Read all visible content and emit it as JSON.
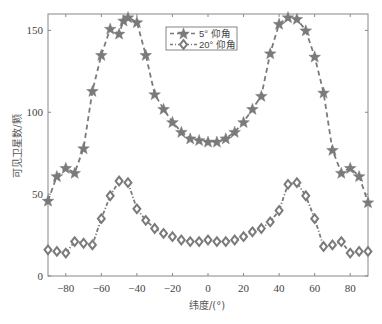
{
  "chart_data": {
    "type": "line",
    "title": "",
    "xlabel": "纬度/(°)",
    "ylabel": "可见卫星数/颗",
    "xlim": [
      -90,
      90
    ],
    "ylim": [
      0,
      160
    ],
    "xticks": [
      -80,
      -60,
      -40,
      -20,
      0,
      20,
      40,
      60,
      80
    ],
    "yticks": [
      0,
      50,
      100,
      150
    ],
    "xtick_labels": [
      "−80",
      "−60",
      "−40",
      "−20",
      "0",
      "20",
      "40",
      "60",
      "80"
    ],
    "ytick_labels": [
      "0",
      "50",
      "100",
      "150"
    ],
    "grid": false,
    "legend": {
      "placement": "top-center"
    },
    "series": [
      {
        "name": "5° 仰角",
        "marker": "star",
        "line_style": "dashed",
        "color": "#7a7a7a",
        "x": [
          -90,
          -85,
          -80,
          -75,
          -70,
          -65,
          -60,
          -55,
          -50,
          -47.5,
          -45,
          -40,
          -35,
          -30,
          -25,
          -20,
          -15,
          -10,
          -5,
          0,
          5,
          10,
          15,
          20,
          25,
          30,
          35,
          40,
          45,
          50,
          55,
          60,
          65,
          70,
          75,
          80,
          85,
          90
        ],
        "values": [
          46,
          61,
          66,
          63,
          78,
          113,
          135,
          151,
          148,
          156,
          158,
          155,
          135,
          111,
          102,
          94,
          88,
          84,
          83,
          82,
          82,
          84,
          88,
          94,
          102,
          110,
          136,
          154,
          158,
          157,
          150,
          134,
          112,
          77,
          63,
          66,
          61,
          45
        ]
      },
      {
        "name": "20° 仰角",
        "marker": "diamond",
        "line_style": "dash-dot",
        "color": "#7a7a7a",
        "x": [
          -90,
          -85,
          -80,
          -75,
          -70,
          -65,
          -60,
          -55,
          -50,
          -45,
          -40,
          -35,
          -30,
          -25,
          -20,
          -15,
          -10,
          -5,
          0,
          5,
          10,
          15,
          20,
          25,
          30,
          35,
          40,
          45,
          50,
          55,
          60,
          65,
          70,
          75,
          80,
          85,
          90
        ],
        "values": [
          16,
          15,
          14,
          21,
          20,
          19,
          35,
          49,
          58,
          57,
          41,
          34,
          29,
          26,
          24,
          22,
          21,
          21,
          22,
          21,
          21,
          22,
          24,
          27,
          29,
          33,
          40,
          56,
          57,
          49,
          35,
          18,
          19,
          21,
          14,
          15,
          15
        ]
      }
    ]
  }
}
